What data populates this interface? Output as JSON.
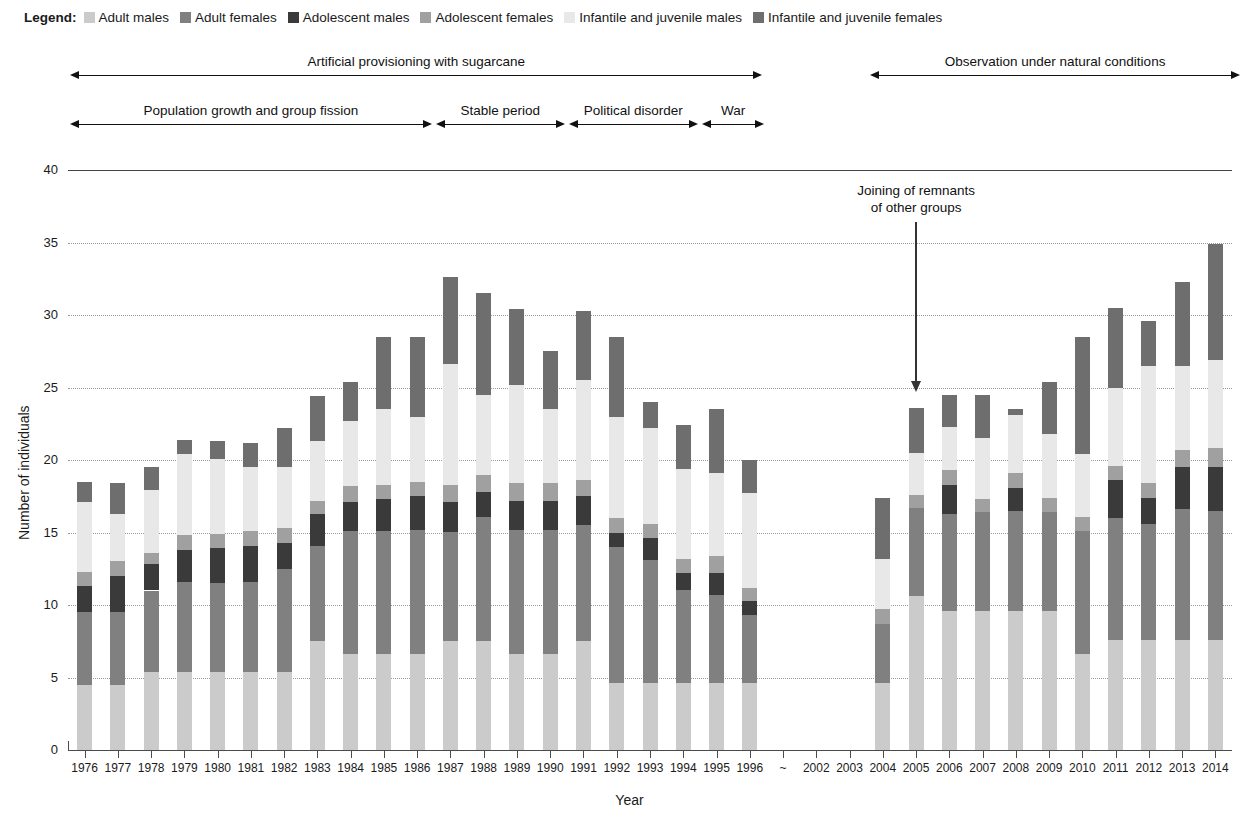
{
  "legend": {
    "title": "Legend:",
    "items": [
      {
        "label": "Adult males",
        "color": "#cbcbcb",
        "key": "adult_males"
      },
      {
        "label": "Adult females",
        "color": "#808080",
        "key": "adult_females"
      },
      {
        "label": "Adolescent males",
        "color": "#3a3a3a",
        "key": "adolescent_males"
      },
      {
        "label": "Adolescent females",
        "color": "#a0a0a0",
        "key": "adolescent_females"
      },
      {
        "label": "Infantile and juvenile males",
        "color": "#e8e8e8",
        "key": "infantile_juvenile_males"
      },
      {
        "label": "Infantile and juvenile females",
        "color": "#6e6e6e",
        "key": "infantile_juvenile_females"
      }
    ]
  },
  "periods_top": [
    {
      "label": "Artificial provisioning with sugarcane",
      "start_year": "1976",
      "end_year": "1996"
    },
    {
      "label": "Observation under natural conditions",
      "start_year": "2002",
      "end_year": "2014"
    }
  ],
  "periods_bottom": [
    {
      "label": "Population growth and group fission",
      "start_year": "1976",
      "end_year": "1986"
    },
    {
      "label": "Stable period",
      "start_year": "1987",
      "end_year": "1990"
    },
    {
      "label": "Political disorder",
      "start_year": "1991",
      "end_year": "1994"
    },
    {
      "label": "War",
      "start_year": "1995",
      "end_year": "1996"
    }
  ],
  "annotation": {
    "line1": "Joining of remnants",
    "line2": "of other groups",
    "target_year": "2005"
  },
  "chart_data": {
    "type": "bar",
    "stacked": true,
    "title": "",
    "xlabel": "Year",
    "ylabel": "Number of individuals",
    "ylim": [
      0,
      40
    ],
    "yticks": [
      0,
      5,
      10,
      15,
      20,
      25,
      30,
      35,
      40
    ],
    "grid": true,
    "legend_position": "top",
    "categories": [
      "1976",
      "1977",
      "1978",
      "1979",
      "1980",
      "1981",
      "1982",
      "1983",
      "1984",
      "1985",
      "1986",
      "1987",
      "1988",
      "1989",
      "1990",
      "1991",
      "1992",
      "1993",
      "1994",
      "1995",
      "1996",
      "~",
      "2002",
      "2003",
      "2004",
      "2005",
      "2006",
      "2007",
      "2008",
      "2009",
      "2010",
      "2011",
      "2012",
      "2013",
      "2014"
    ],
    "gap_categories": [
      "~",
      "2002",
      "2003"
    ],
    "series": [
      {
        "name": "Adult males",
        "color": "#cbcbcb",
        "values": [
          4.5,
          4.5,
          5.4,
          5.4,
          5.4,
          5.4,
          5.4,
          7.5,
          6.6,
          6.6,
          6.6,
          7.5,
          7.5,
          6.6,
          6.6,
          7.5,
          4.6,
          4.6,
          4.6,
          4.6,
          4.6,
          null,
          null,
          null,
          4.6,
          10.6,
          9.6,
          9.6,
          9.6,
          9.6,
          6.6,
          7.6,
          7.6,
          7.6,
          7.6
        ]
      },
      {
        "name": "Adult females",
        "color": "#808080",
        "values": [
          5.0,
          5.0,
          5.6,
          6.2,
          6.1,
          6.2,
          7.1,
          6.6,
          8.5,
          8.5,
          8.6,
          7.5,
          8.6,
          8.6,
          8.6,
          8.0,
          9.4,
          8.5,
          6.4,
          6.1,
          4.7,
          null,
          null,
          null,
          4.1,
          6.1,
          6.7,
          6.8,
          6.9,
          6.8,
          8.5,
          8.4,
          8.0,
          9.0,
          8.9
        ]
      },
      {
        "name": "Adolescent males",
        "color": "#3a3a3a",
        "values": [
          1.8,
          2.5,
          1.8,
          2.2,
          2.4,
          2.5,
          1.8,
          2.2,
          2.0,
          2.2,
          2.3,
          2.1,
          1.7,
          2.0,
          2.0,
          2.0,
          1.0,
          1.5,
          1.2,
          1.5,
          1.0,
          null,
          null,
          null,
          0.0,
          0.0,
          2.0,
          0.0,
          1.6,
          0.0,
          0.0,
          2.6,
          1.8,
          2.9,
          3.0
        ]
      },
      {
        "name": "Adolescent females",
        "color": "#a0a0a0",
        "values": [
          1.0,
          1.0,
          0.8,
          1.0,
          1.0,
          1.0,
          1.0,
          0.9,
          1.1,
          1.0,
          1.0,
          1.2,
          1.2,
          1.2,
          1.2,
          1.1,
          1.0,
          1.0,
          1.0,
          1.2,
          0.9,
          null,
          null,
          null,
          1.0,
          0.9,
          1.0,
          0.9,
          1.0,
          1.0,
          1.0,
          1.0,
          1.0,
          1.2,
          1.3
        ]
      },
      {
        "name": "Infantile and juvenile males",
        "color": "#e8e8e8",
        "values": [
          4.8,
          3.3,
          4.3,
          5.6,
          5.2,
          4.4,
          4.2,
          4.1,
          4.5,
          5.2,
          4.5,
          8.3,
          5.5,
          6.8,
          5.1,
          6.9,
          7.0,
          6.6,
          6.2,
          5.7,
          6.5,
          null,
          null,
          null,
          3.5,
          2.9,
          3.0,
          4.2,
          4.0,
          4.4,
          4.3,
          5.4,
          8.1,
          5.8,
          6.1
        ]
      },
      {
        "name": "Infantile and juvenile females",
        "color": "#6e6e6e",
        "values": [
          1.4,
          2.1,
          1.6,
          1.0,
          1.2,
          1.7,
          2.7,
          3.1,
          2.7,
          5.0,
          5.5,
          6.0,
          7.0,
          5.2,
          4.0,
          4.8,
          5.5,
          1.8,
          3.0,
          4.4,
          2.3,
          null,
          null,
          null,
          4.2,
          3.1,
          2.2,
          3.0,
          0.4,
          3.6,
          8.1,
          5.5,
          3.1,
          5.8,
          8.0
        ]
      }
    ],
    "totals": [
      18.5,
      18.4,
      19.5,
      21.4,
      21.3,
      21.2,
      22.2,
      24.4,
      25.4,
      28.5,
      28.5,
      32.6,
      31.5,
      30.4,
      27.5,
      30.3,
      28.0,
      23.0,
      22.4,
      23.5,
      20.0,
      null,
      null,
      null,
      17.4,
      23.6,
      24.5,
      24.5,
      23.5,
      25.4,
      28.5,
      30.5,
      29.6,
      32.3,
      36.4
    ]
  }
}
